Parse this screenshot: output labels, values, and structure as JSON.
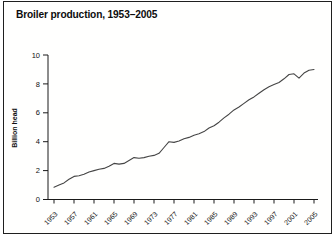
{
  "panel": {
    "title": "Broiler production, 1953–2005"
  },
  "colors": {
    "background": "#fffffe",
    "border": "#1f1f1f",
    "axis": "#1a1a1a",
    "line": "#454545",
    "text": "#111111"
  },
  "chart_data": {
    "type": "line",
    "title": "Broiler production, 1953–2005",
    "xlabel": "",
    "ylabel": "Billion head",
    "ylim": [
      0,
      10
    ],
    "yticks": [
      0,
      2,
      4,
      6,
      8,
      10
    ],
    "xticks": [
      1953,
      1957,
      1961,
      1965,
      1969,
      1973,
      1977,
      1981,
      1985,
      1989,
      1993,
      1997,
      2001,
      2005
    ],
    "grid": false,
    "legend": "none",
    "x": [
      1953,
      1954,
      1955,
      1956,
      1957,
      1958,
      1959,
      1960,
      1961,
      1962,
      1963,
      1964,
      1965,
      1966,
      1967,
      1968,
      1969,
      1970,
      1971,
      1972,
      1973,
      1974,
      1975,
      1976,
      1977,
      1978,
      1979,
      1980,
      1981,
      1982,
      1983,
      1984,
      1985,
      1986,
      1987,
      1988,
      1989,
      1990,
      1991,
      1992,
      1993,
      1994,
      1995,
      1996,
      1997,
      1998,
      1999,
      2000,
      2001,
      2002,
      2003,
      2004,
      2005
    ],
    "values": [
      0.85,
      1.0,
      1.15,
      1.4,
      1.6,
      1.65,
      1.75,
      1.9,
      2.0,
      2.1,
      2.15,
      2.3,
      2.5,
      2.45,
      2.5,
      2.7,
      2.9,
      2.85,
      2.9,
      3.0,
      3.05,
      3.2,
      3.6,
      4.0,
      3.95,
      4.05,
      4.2,
      4.3,
      4.45,
      4.55,
      4.7,
      4.95,
      5.1,
      5.35,
      5.65,
      5.9,
      6.2,
      6.4,
      6.65,
      6.9,
      7.1,
      7.35,
      7.6,
      7.8,
      7.95,
      8.1,
      8.35,
      8.65,
      8.7,
      8.4,
      8.75,
      8.95,
      9.0
    ]
  }
}
